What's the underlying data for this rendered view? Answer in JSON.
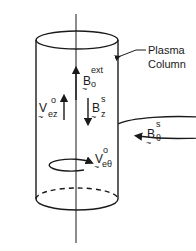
{
  "diagram": {
    "type": "plasma-column-schematic",
    "labels": {
      "plasma_column_line1": "Plasma",
      "plasma_column_line2": "Column",
      "b_ext": {
        "base": "B",
        "sub": "o",
        "sup": "ext"
      },
      "b_z": {
        "base": "B",
        "sub": "z",
        "sup": "s"
      },
      "v_ez": {
        "base": "V",
        "sub": "ez",
        "sup": "o"
      },
      "b_theta": {
        "base": "B",
        "sub": "θ",
        "sup": "s"
      },
      "v_etheta": {
        "base": "V",
        "sub": "eθ",
        "sup": "o"
      }
    },
    "vector_tilde": "~",
    "colors": {
      "ink": "#1a1a1a",
      "background": "#ffffff"
    }
  }
}
